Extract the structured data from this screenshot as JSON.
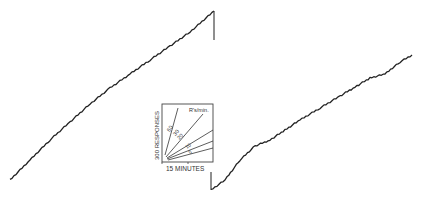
{
  "chart_data": {
    "type": "line",
    "title": "",
    "series": [
      {
        "name": "segment-1",
        "points": [
          [
            10,
            180
          ],
          [
            30,
            160
          ],
          [
            50,
            140
          ],
          [
            70,
            122
          ],
          [
            90,
            104
          ],
          [
            110,
            88
          ],
          [
            130,
            74
          ],
          [
            150,
            60
          ],
          [
            170,
            46
          ],
          [
            190,
            32
          ],
          [
            214,
            11
          ]
        ],
        "reset": {
          "x": 214,
          "from_y": 11,
          "to_y": 40
        }
      },
      {
        "name": "segment-2",
        "start_tick": {
          "x": 211,
          "from_y": 172,
          "to_y": 190
        },
        "points": [
          [
            211,
            190
          ],
          [
            225,
            180
          ],
          [
            240,
            160
          ],
          [
            255,
            146
          ],
          [
            270,
            140
          ],
          [
            285,
            130
          ],
          [
            300,
            120
          ],
          [
            320,
            108
          ],
          [
            340,
            96
          ],
          [
            355,
            87
          ],
          [
            370,
            78
          ],
          [
            385,
            74
          ],
          [
            400,
            62
          ],
          [
            412,
            55
          ]
        ]
      }
    ],
    "inset": {
      "xlabel": "15 MINUTES",
      "ylabel": "300 RESPONSES",
      "legend_title": "R's/min.",
      "rate_lines": [
        {
          "label": "60"
        },
        {
          "label": "30"
        },
        {
          "label": "20"
        },
        {
          "label": "10"
        },
        {
          "label": "5"
        }
      ]
    }
  }
}
